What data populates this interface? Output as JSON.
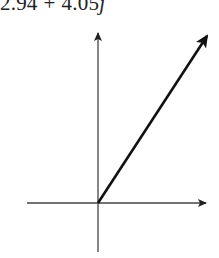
{
  "expression": {
    "real": "2.94",
    "operator": "+",
    "imag": "4.05",
    "unit": "j"
  },
  "diagram": {
    "type": "complex-plane-vector",
    "origin": [
      98,
      203
    ],
    "x_axis": {
      "from": [
        27,
        203
      ],
      "to": [
        207,
        203
      ],
      "arrow": true
    },
    "y_axis": {
      "from": [
        98,
        252
      ],
      "to": [
        98,
        32
      ],
      "arrow": true
    },
    "vector": {
      "from": [
        98,
        203
      ],
      "to": [
        208,
        34
      ],
      "real": 2.94,
      "imag": 4.05
    },
    "colors": {
      "axis": "#333333",
      "vector": "#111111",
      "background": "#ffffff"
    }
  }
}
